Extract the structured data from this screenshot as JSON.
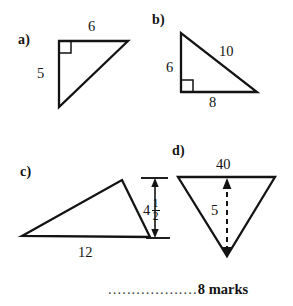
{
  "worksheet": {
    "footer": {
      "dots": "...................",
      "marks_text": "8 marks"
    },
    "ink_color": "#131313",
    "background_color": "#ffffff"
  },
  "figures": [
    {
      "id": "a",
      "part_label": "a)",
      "shape": "right-triangle",
      "right_angle": true,
      "right_angle_corner": "top-left",
      "labels": {
        "top": "6",
        "left": "5"
      },
      "vertices": [
        [
          59,
          41
        ],
        [
          128,
          41
        ],
        [
          59,
          107
        ]
      ]
    },
    {
      "id": "b",
      "part_label": "b)",
      "shape": "right-triangle",
      "right_angle": true,
      "right_angle_corner": "bottom-left",
      "labels": {
        "left": "6",
        "hypotenuse": "10",
        "bottom": "8"
      },
      "vertices": [
        [
          181,
          33
        ],
        [
          181,
          92
        ],
        [
          257,
          92
        ]
      ]
    },
    {
      "id": "c",
      "part_label": "c)",
      "shape": "scalene-triangle",
      "right_angle": false,
      "labels": {
        "base": "12",
        "height_whole": "4",
        "height_numerator": "1",
        "height_denominator": "2"
      },
      "vertices": [
        [
          22,
          236
        ],
        [
          122,
          180
        ],
        [
          150,
          237
        ]
      ],
      "dimension": {
        "type": "vertical-double-arrow",
        "position": "right"
      }
    },
    {
      "id": "d",
      "part_label": "d)",
      "shape": "inverted-triangle",
      "right_angle": false,
      "labels": {
        "base": "40",
        "height": "5"
      },
      "vertices": [
        [
          178,
          177
        ],
        [
          275,
          177
        ],
        [
          227,
          256
        ]
      ],
      "dimension": {
        "type": "dashed-double-arrow",
        "position": "center-vertical"
      }
    }
  ]
}
